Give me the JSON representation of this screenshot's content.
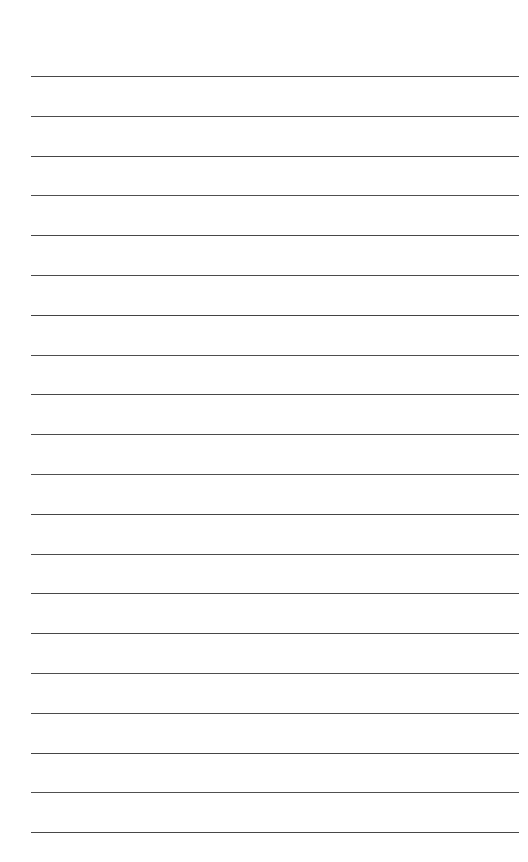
{
  "page": {
    "kind": "blank-lined-paper",
    "width": 528,
    "height": 862,
    "background_color": "#ffffff",
    "text_content": "",
    "ruling": {
      "line_color": "#3d3d3d",
      "line_count": 20,
      "line_thickness_px": 1.5,
      "line_start_x": 31,
      "line_end_x": 519,
      "line_length_px": 488,
      "left_margin_px": 31,
      "right_margin_px": 9,
      "top_margin_px": 76,
      "bottom_margin_px": 29,
      "line_spacing_px": 39.8,
      "line_y_positions": [
        76,
        115.8,
        155.6,
        195.4,
        235.2,
        275,
        314.8,
        354.6,
        394.4,
        434.2,
        474,
        513.8,
        553.6,
        593.4,
        633.2,
        673,
        712.8,
        752.6,
        792.4,
        832.2
      ],
      "line_opacities": [
        0.95,
        0.92,
        0.96,
        0.9,
        0.94,
        0.93,
        0.97,
        0.91,
        0.95,
        0.93,
        0.9,
        0.96,
        0.92,
        0.94,
        0.95,
        0.91,
        0.93,
        0.96,
        0.9,
        0.94
      ]
    }
  }
}
